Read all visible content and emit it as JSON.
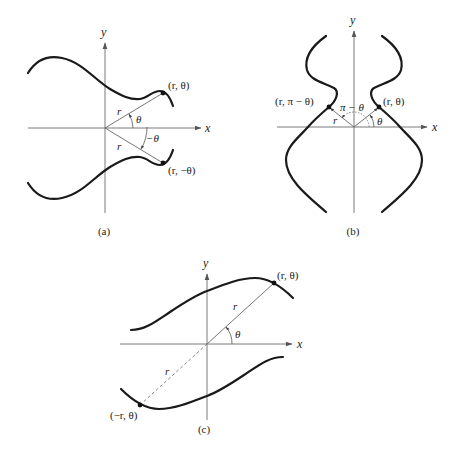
{
  "figure": {
    "panels": [
      {
        "id": "a",
        "caption": "(a)",
        "axis_labels": {
          "x": "x",
          "y": "y"
        },
        "points": [
          {
            "label": "(r, θ)"
          },
          {
            "label": "(r, −θ)"
          }
        ],
        "segment_labels": {
          "r_upper": "r",
          "r_lower": "r"
        },
        "angle_labels": {
          "theta": "θ",
          "neg_theta": "−θ"
        },
        "description": "Symmetry with respect to the x-axis"
      },
      {
        "id": "b",
        "caption": "(b)",
        "axis_labels": {
          "x": "x",
          "y": "y"
        },
        "points": [
          {
            "label": "(r, π − θ)"
          },
          {
            "label": "(r, θ)"
          }
        ],
        "segment_labels": {
          "r_left": "r"
        },
        "angle_labels": {
          "theta": "θ",
          "pi_minus_theta": "π − θ"
        },
        "description": "Symmetry with respect to the y-axis"
      },
      {
        "id": "c",
        "caption": "(c)",
        "axis_labels": {
          "x": "x",
          "y": "y"
        },
        "points": [
          {
            "label": "(r, θ)"
          },
          {
            "label": "(−r, θ)"
          }
        ],
        "segment_labels": {
          "r_upper": "r",
          "r_lower": "r"
        },
        "angle_labels": {
          "theta": "θ"
        },
        "description": "Symmetry with respect to the origin"
      }
    ],
    "colors": {
      "curve": "#1a1a1a",
      "axis": "#7a7a7a",
      "background": "#ffffff"
    }
  }
}
